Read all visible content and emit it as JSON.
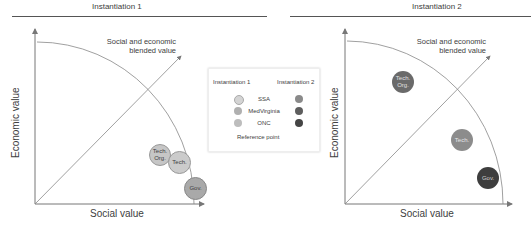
{
  "panels": [
    {
      "title": "Instantiation 1",
      "x_label": "Social value",
      "y_label": "Economic value",
      "diagonal_label_line1": "Social and economic",
      "diagonal_label_line2": "blended value",
      "bubbles": [
        {
          "label_line1": "Tech.",
          "label_line2": "Org.",
          "organization": "SSA",
          "color": "#c8c8c8"
        },
        {
          "label_line1": "Tech.",
          "label_line2": "",
          "organization": "MedVirginia",
          "color": "#c0c0c0"
        },
        {
          "label_line1": "Gov.",
          "label_line2": "",
          "organization": "ONC",
          "color": "#a8a8a8"
        }
      ]
    },
    {
      "title": "Instantiation 2",
      "x_label": "Social value",
      "y_label": "Economic value",
      "diagonal_label_line1": "Social and economic",
      "diagonal_label_line2": "blended value",
      "bubbles": [
        {
          "label_line1": "Tech.",
          "label_line2": "Org.",
          "organization": "SSA",
          "color": "#6e6e6e"
        },
        {
          "label_line1": "Tech.",
          "label_line2": "",
          "organization": "MedVirginia",
          "color": "#8a8a8a"
        },
        {
          "label_line1": "Gov.",
          "label_line2": "",
          "organization": "ONC",
          "color": "#404040"
        }
      ]
    }
  ],
  "legend": {
    "header_left": "Instantiation 1",
    "header_right": "Instantiation 2",
    "rows": [
      {
        "label": "SSA",
        "color1": "#d4d4d4",
        "color2": "#8a8a8a"
      },
      {
        "label": "MedVirginia",
        "color1": "#b0b0b0",
        "color2": "#5e5e5e"
      },
      {
        "label": "ONC",
        "color1": "#bdbdbd",
        "color2": "#454545"
      }
    ],
    "reference_label": "Reference point"
  },
  "colors": {
    "axis": "#7a7a7a",
    "text": "#404040"
  }
}
